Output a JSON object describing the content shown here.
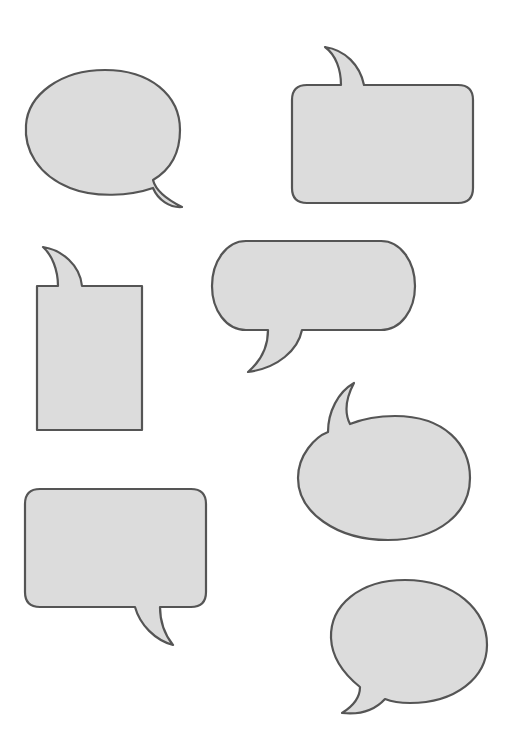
{
  "page": {
    "background": "#ffffff",
    "bubble_fill": "#dcdcdc",
    "bubble_stroke": "#555555"
  },
  "bubbles": [
    {
      "id": 1,
      "shape": "oval",
      "tail": "bottom-right",
      "text": ""
    },
    {
      "id": 2,
      "shape": "rounded-rectangle",
      "tail": "top-left",
      "text": ""
    },
    {
      "id": 3,
      "shape": "rectangle",
      "tail": "top-left",
      "text": ""
    },
    {
      "id": 4,
      "shape": "pill",
      "tail": "bottom-left",
      "text": ""
    },
    {
      "id": 5,
      "shape": "ellipse",
      "tail": "top-left",
      "text": ""
    },
    {
      "id": 6,
      "shape": "rounded-rectangle",
      "tail": "bottom-right",
      "text": ""
    },
    {
      "id": 7,
      "shape": "oval",
      "tail": "bottom-left",
      "text": ""
    }
  ]
}
